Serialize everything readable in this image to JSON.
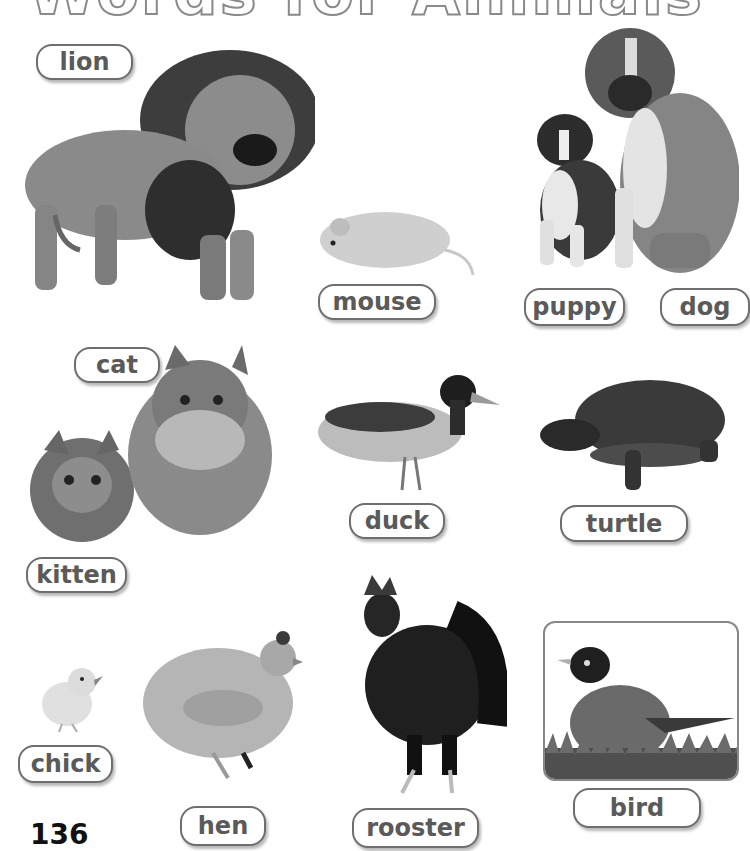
{
  "page": {
    "title": "Words for Animals",
    "page_number": "136"
  },
  "labels": {
    "lion": "lion",
    "mouse": "mouse",
    "puppy": "puppy",
    "dog": "dog",
    "cat": "cat",
    "kitten": "kitten",
    "duck": "duck",
    "turtle": "turtle",
    "chick": "chick",
    "hen": "hen",
    "rooster": "rooster",
    "bird": "bird"
  },
  "images": [
    {
      "name": "lion",
      "description": "roaring male lion, standing"
    },
    {
      "name": "mouse",
      "description": "small white mouse"
    },
    {
      "name": "puppy",
      "description": "boxer puppy sitting"
    },
    {
      "name": "dog",
      "description": "adult boxer dog sitting"
    },
    {
      "name": "cat",
      "description": "long-haired adult cat"
    },
    {
      "name": "kitten",
      "description": "fluffy kitten"
    },
    {
      "name": "duck",
      "description": "mallard duck standing"
    },
    {
      "name": "turtle",
      "description": "turtle walking"
    },
    {
      "name": "chick",
      "description": "baby chick"
    },
    {
      "name": "hen",
      "description": "light-colored hen"
    },
    {
      "name": "rooster",
      "description": "dark speckled rooster"
    },
    {
      "name": "bird",
      "description": "robin standing on grass, framed photo"
    }
  ],
  "colors": {
    "pill_border": "#6e6e6e",
    "pill_text": "#5a5a5a",
    "background": "#ffffff"
  }
}
